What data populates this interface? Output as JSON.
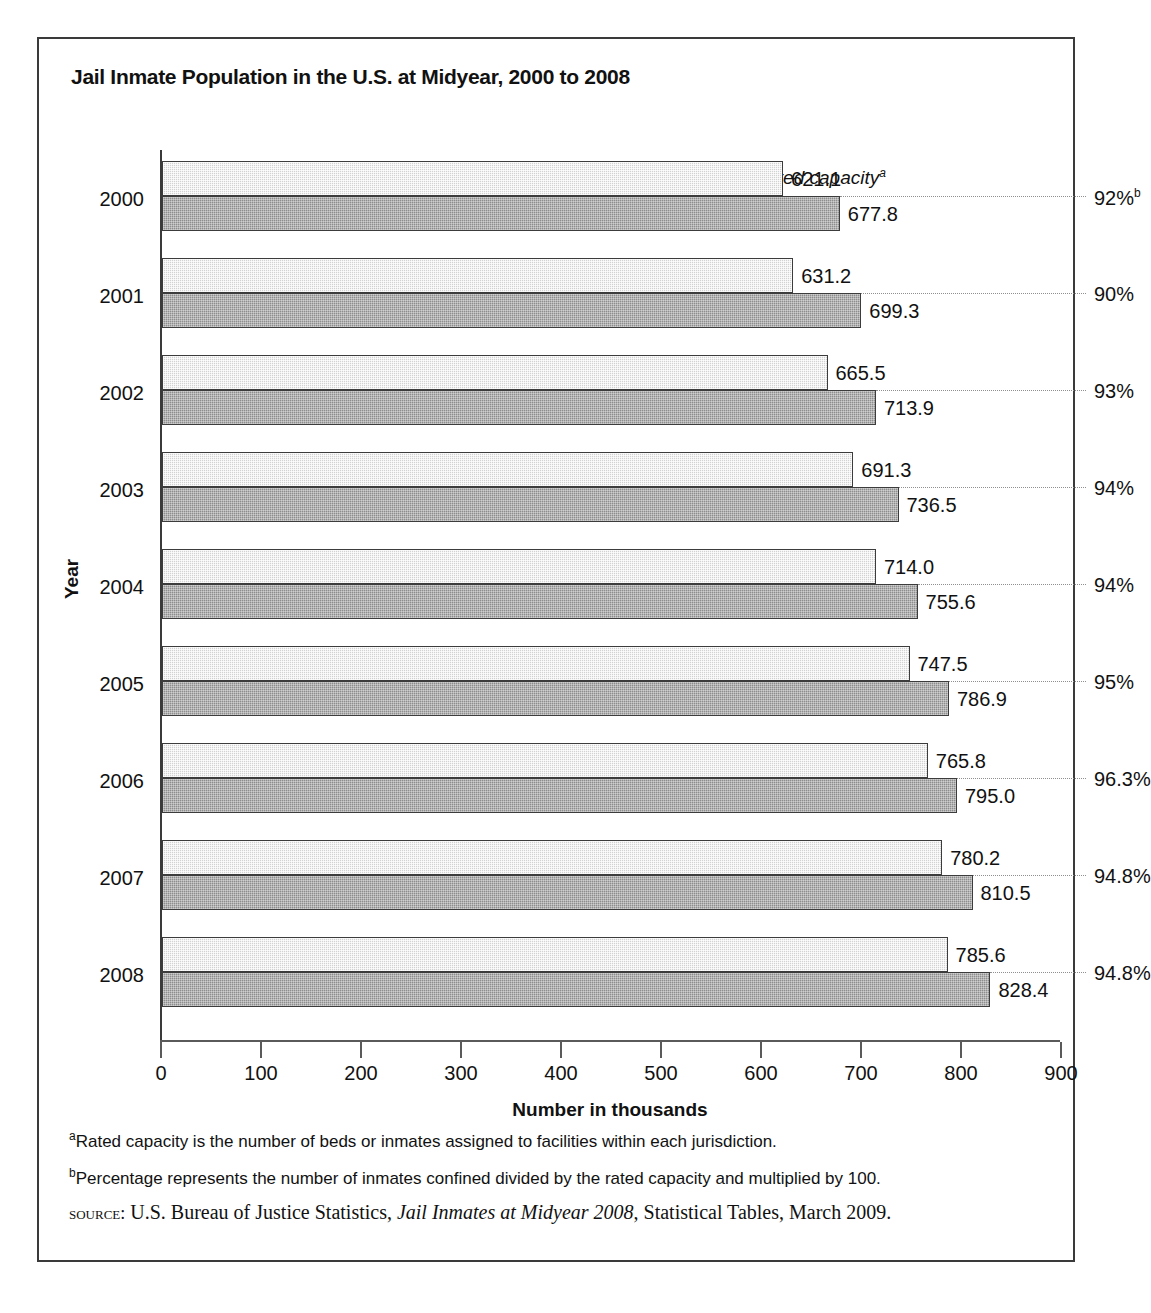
{
  "chart_data": {
    "type": "bar",
    "orientation": "horizontal",
    "title": "Jail Inmate Population in the U.S. at Midyear, 2000 to 2008",
    "xlabel": "Number in thousands",
    "ylabel": "Year",
    "xlim": [
      0,
      900
    ],
    "xticks": [
      0,
      100,
      200,
      300,
      400,
      500,
      600,
      700,
      800,
      900
    ],
    "xtick_labels": [
      "0",
      "100",
      "200",
      "300",
      "400",
      "500",
      "600",
      "700",
      "800",
      "900"
    ],
    "grid": false,
    "legend_position": "top-center",
    "categories": [
      "2000",
      "2001",
      "2002",
      "2003",
      "2004",
      "2005",
      "2006",
      "2007",
      "2008"
    ],
    "series": [
      {
        "name": "Number of inmates",
        "color": "#d2d2d2",
        "values": [
          621.1,
          631.2,
          665.5,
          691.3,
          714.0,
          747.5,
          765.8,
          780.2,
          785.6
        ],
        "labels": [
          "621.1",
          "631.2",
          "665.5",
          "691.3",
          "714.0",
          "747.5",
          "765.8",
          "780.2",
          "785.6"
        ]
      },
      {
        "name": "Rated capacity",
        "color": "#8d8d8d",
        "values": [
          677.8,
          699.3,
          713.9,
          736.5,
          755.6,
          786.9,
          795.0,
          810.5,
          828.4
        ],
        "labels": [
          "677.8",
          "699.3",
          "713.9",
          "736.5",
          "755.6",
          "786.9",
          "795.0",
          "810.5",
          "828.4"
        ]
      }
    ],
    "annotations": {
      "name": "Percent of capacity occupied",
      "values": [
        92,
        90,
        93,
        94,
        94,
        95,
        96.3,
        94.8,
        94.8
      ],
      "labels": [
        "92%",
        "90%",
        "93%",
        "94%",
        "94%",
        "95%",
        "96.3%",
        "94.8%",
        "94.8%"
      ],
      "first_label_superscript": "b"
    }
  },
  "legend": {
    "entries": [
      {
        "label": "Number of inmates",
        "superscript": ""
      },
      {
        "label": "Rated capacity",
        "superscript": "a"
      }
    ]
  },
  "footnotes": [
    {
      "marker": "a",
      "text": "Rated capacity is the number of beds or inmates assigned to facilities within each jurisdiction."
    },
    {
      "marker": "b",
      "text": "Percentage represents the number of inmates confined divided by the rated capacity and multiplied by 100."
    }
  ],
  "source": {
    "keyword": "source:",
    "before": " U.S. Bureau of Justice Statistics, ",
    "title": "Jail Inmates at Midyear 2008",
    "after": ", Statistical Tables, March 2009."
  }
}
